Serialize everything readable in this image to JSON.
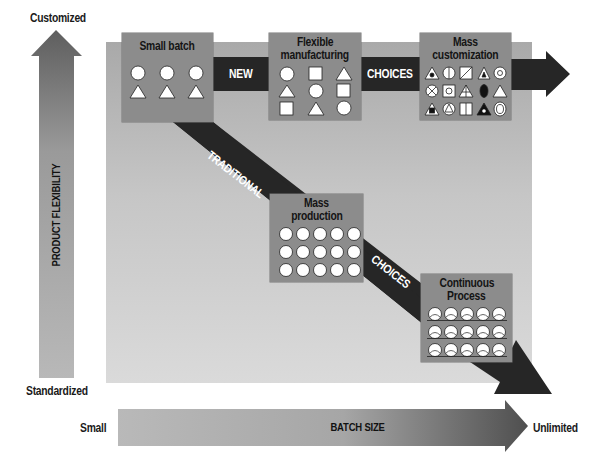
{
  "axes": {
    "y": {
      "title": "PRODUCT FLEXIBILITY",
      "top_label": "Customized",
      "bottom_label": "Standardized"
    },
    "x": {
      "title": "BATCH SIZE",
      "left_label": "Small",
      "right_label": "Unlimited"
    }
  },
  "paths": {
    "new_choices": {
      "labels": [
        "NEW",
        "CHOICES"
      ]
    },
    "traditional_choices": {
      "labels": [
        "TRADITIONAL",
        "CHOICES"
      ]
    }
  },
  "boxes": {
    "small_batch": {
      "title": "Small batch",
      "symbols": [
        [
          "circle",
          "circle",
          "circle"
        ],
        [
          "triangle",
          "triangle",
          "triangle"
        ]
      ]
    },
    "flexible_manufacturing": {
      "title_line1": "Flexible",
      "title_line2": "manufacturing",
      "symbols": [
        [
          "circle",
          "square",
          "triangle"
        ],
        [
          "triangle",
          "circle",
          "square"
        ],
        [
          "square",
          "triangle",
          "circle"
        ]
      ]
    },
    "mass_customization": {
      "title_line1": "Mass",
      "title_line2": "customization",
      "symbols": [
        [
          "triangle-dot",
          "circle-split",
          "square-diagonal",
          "triangle-inner",
          "circle-ring"
        ],
        [
          "circle-x",
          "square-inner",
          "triangle-cross",
          "ellipse-filled",
          "triangle"
        ],
        [
          "triangle-square",
          "circle-triangle",
          "square-split",
          "triangle-filled",
          "ellipse-ring"
        ]
      ]
    },
    "mass_production": {
      "title_line1": "Mass",
      "title_line2": "production",
      "symbols": "5x3 circles"
    },
    "continuous_process": {
      "title_line1": "Continuous",
      "title_line2": "Process",
      "symbols": "5x3 flowing circles"
    }
  },
  "colors": {
    "band": "#262626",
    "box": "#8c8c8c",
    "panel_top": "#a9a9a9",
    "panel_bottom": "#dadada",
    "symbol_fill": "#ffffff"
  }
}
